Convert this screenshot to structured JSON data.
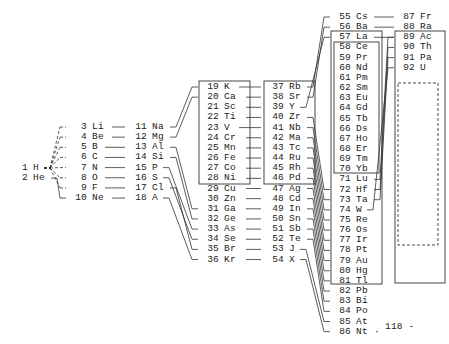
{
  "periods": [
    {
      "id": "p1",
      "x": 16,
      "y0": 163,
      "numw": 12,
      "elements": [
        {
          "n": "1",
          "s": "H"
        },
        {
          "n": "2",
          "s": "He"
        }
      ]
    },
    {
      "id": "p2",
      "x": 70,
      "y0": 122,
      "numw": 17,
      "elements": [
        {
          "n": "3",
          "s": "Li"
        },
        {
          "n": "4",
          "s": "Be"
        },
        {
          "n": "5",
          "s": "B"
        },
        {
          "n": "6",
          "s": "C"
        },
        {
          "n": "7",
          "s": "N"
        },
        {
          "n": "8",
          "s": "O"
        },
        {
          "n": "9",
          "s": "F"
        },
        {
          "n": "10",
          "s": "Ne"
        }
      ]
    },
    {
      "id": "p3",
      "x": 130,
      "y0": 122,
      "numw": 17,
      "elements": [
        {
          "n": "11",
          "s": "Na"
        },
        {
          "n": "12",
          "s": "Mg"
        },
        {
          "n": "13",
          "s": "Al"
        },
        {
          "n": "14",
          "s": "Si"
        },
        {
          "n": "15",
          "s": "P"
        },
        {
          "n": "16",
          "s": "S"
        },
        {
          "n": "17",
          "s": "Cl"
        },
        {
          "n": "18",
          "s": "A"
        }
      ]
    },
    {
      "id": "p4",
      "x": 202,
      "y0": 82,
      "numw": 17,
      "elements": [
        {
          "n": "19",
          "s": "K"
        },
        {
          "n": "20",
          "s": "Ca"
        },
        {
          "n": "21",
          "s": "Sc"
        },
        {
          "n": "22",
          "s": "Ti"
        },
        {
          "n": "23",
          "s": "V"
        },
        {
          "n": "24",
          "s": "Cr"
        },
        {
          "n": "25",
          "s": "Mn"
        },
        {
          "n": "26",
          "s": "Fe"
        },
        {
          "n": "27",
          "s": "Co"
        },
        {
          "n": "28",
          "s": "Ni"
        },
        {
          "n": "29",
          "s": "Cu"
        },
        {
          "n": "30",
          "s": "Zn"
        },
        {
          "n": "31",
          "s": "Ga"
        },
        {
          "n": "32",
          "s": "Ge"
        },
        {
          "n": "33",
          "s": "As"
        },
        {
          "n": "34",
          "s": "Se"
        },
        {
          "n": "35",
          "s": "Br"
        },
        {
          "n": "36",
          "s": "Kr"
        }
      ]
    },
    {
      "id": "p5",
      "x": 267,
      "y0": 82,
      "numw": 17,
      "elements": [
        {
          "n": "37",
          "s": "Rb"
        },
        {
          "n": "38",
          "s": "Sr"
        },
        {
          "n": "39",
          "s": "Y"
        },
        {
          "n": "40",
          "s": "Zr"
        },
        {
          "n": "41",
          "s": "Nb"
        },
        {
          "n": "42",
          "s": "Ma"
        },
        {
          "n": "43",
          "s": "Tc"
        },
        {
          "n": "44",
          "s": "Ru"
        },
        {
          "n": "45",
          "s": "Rh"
        },
        {
          "n": "46",
          "s": "Pd"
        },
        {
          "n": "47",
          "s": "Ag"
        },
        {
          "n": "48",
          "s": "Cd"
        },
        {
          "n": "49",
          "s": "In"
        },
        {
          "n": "50",
          "s": "Sn"
        },
        {
          "n": "51",
          "s": "Sb"
        },
        {
          "n": "52",
          "s": "Te"
        },
        {
          "n": "53",
          "s": "J"
        },
        {
          "n": "54",
          "s": "X"
        }
      ]
    },
    {
      "id": "p6",
      "x": 334,
      "y0": 12,
      "numw": 17,
      "elements": [
        {
          "n": "55",
          "s": "Cs"
        },
        {
          "n": "56",
          "s": "Ba"
        },
        {
          "n": "57",
          "s": "La"
        },
        {
          "n": "58",
          "s": "Ce"
        },
        {
          "n": "59",
          "s": "Pr"
        },
        {
          "n": "60",
          "s": "Nd"
        },
        {
          "n": "61",
          "s": "Pm"
        },
        {
          "n": "62",
          "s": "Sm"
        },
        {
          "n": "63",
          "s": "Eu"
        },
        {
          "n": "64",
          "s": "Gd"
        },
        {
          "n": "65",
          "s": "Tb"
        },
        {
          "n": "66",
          "s": "Ds"
        },
        {
          "n": "67",
          "s": "Ho"
        },
        {
          "n": "68",
          "s": "Er"
        },
        {
          "n": "69",
          "s": "Tm"
        },
        {
          "n": "70",
          "s": "Yb"
        },
        {
          "n": "71",
          "s": "Lu"
        },
        {
          "n": "72",
          "s": "Hf"
        },
        {
          "n": "73",
          "s": "Ta"
        },
        {
          "n": "74",
          "s": "W"
        },
        {
          "n": "75",
          "s": "Re"
        },
        {
          "n": "76",
          "s": "Os"
        },
        {
          "n": "77",
          "s": "Ir"
        },
        {
          "n": "78",
          "s": "Pt"
        },
        {
          "n": "79",
          "s": "Au"
        },
        {
          "n": "80",
          "s": "Hg"
        },
        {
          "n": "81",
          "s": "Tl"
        },
        {
          "n": "82",
          "s": "Pb"
        },
        {
          "n": "83",
          "s": "Bi"
        },
        {
          "n": "84",
          "s": "Po"
        },
        {
          "n": "85",
          "s": "At"
        },
        {
          "n": "86",
          "s": "Nt"
        }
      ]
    },
    {
      "id": "p7",
      "x": 398,
      "y0": 12,
      "numw": 17,
      "elements": [
        {
          "n": "87",
          "s": "Fr"
        },
        {
          "n": "88",
          "s": "Ra"
        },
        {
          "n": "89",
          "s": "Ac"
        },
        {
          "n": "90",
          "s": "Th"
        },
        {
          "n": "91",
          "s": "Pa"
        },
        {
          "n": "92",
          "s": "U"
        }
      ]
    }
  ],
  "terminal": {
    "label": "118 -"
  },
  "row_height": 10.15
}
